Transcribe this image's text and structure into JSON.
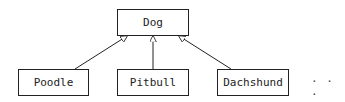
{
  "diagram": {
    "type": "class-inheritance",
    "parent": {
      "label": "Dog"
    },
    "children": [
      {
        "label": "Poodle"
      },
      {
        "label": "Pitbull"
      },
      {
        "label": "Dachshund"
      }
    ],
    "ellipsis": "· · ·",
    "relation": "inherits (hollow triangle arrowhead)"
  }
}
